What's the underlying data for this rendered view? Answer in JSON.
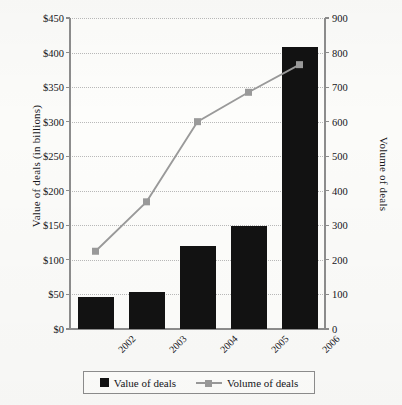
{
  "chart_data": {
    "type": "bar",
    "title": "",
    "categories": [
      "2002",
      "2003",
      "2004",
      "2005",
      "2006"
    ],
    "series": [
      {
        "name": "Value of deals",
        "type": "bar",
        "axis": "left",
        "color": "#121212",
        "values": [
          47,
          53,
          120,
          149,
          408
        ]
      },
      {
        "name": "Volume of deals",
        "type": "line",
        "axis": "right",
        "color": "#9a9a9a",
        "marker": "square",
        "values": [
          225,
          368,
          600,
          685,
          765
        ]
      }
    ],
    "xlabel": "",
    "ylabel": "Value of deals (in billions)",
    "y2label": "Volume of deals",
    "ylim": [
      0,
      450
    ],
    "y2lim": [
      0,
      900
    ],
    "yticks": [
      "$0",
      "$50",
      "$100",
      "$150",
      "$200",
      "$250",
      "$300",
      "$350",
      "$400",
      "$450"
    ],
    "ytick_values": [
      0,
      50,
      100,
      150,
      200,
      250,
      300,
      350,
      400,
      450
    ],
    "y2ticks": [
      "0",
      "100",
      "200",
      "300",
      "400",
      "500",
      "600",
      "700",
      "800",
      "900"
    ],
    "y2tick_values": [
      0,
      100,
      200,
      300,
      400,
      500,
      600,
      700,
      800,
      900
    ],
    "grid": "horizontal-dotted",
    "legend_position": "bottom",
    "legend": [
      "Value of deals",
      "Volume of deals"
    ]
  },
  "axes": {
    "left_title": "Value of deals (in billions)",
    "right_title": "Volume of deals"
  },
  "legend": {
    "items": [
      {
        "label": "Value of deals",
        "icon": "filled-square-marker"
      },
      {
        "label": "Volume of deals",
        "icon": "line-with-square-marker"
      }
    ]
  },
  "colors": {
    "bar": "#121212",
    "line": "#9a9a9a",
    "axis": "#8d8d8d",
    "grid": "#b9b9b9",
    "background": "#fbfbf9",
    "text": "#15151a"
  }
}
